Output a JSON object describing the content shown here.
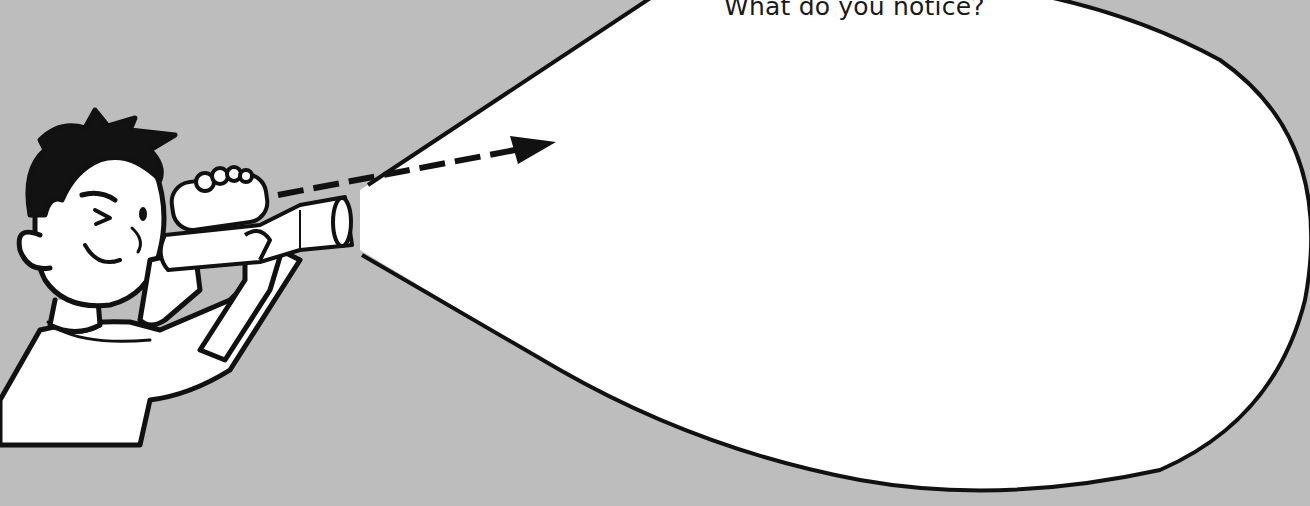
{
  "illustration": {
    "subject": "boy looking through binoculars",
    "prompt_text": "What do you notice?"
  },
  "colors": {
    "background": "#bdbdbd",
    "outline": "#111111",
    "fill": "#ffffff",
    "hair": "#121212"
  }
}
